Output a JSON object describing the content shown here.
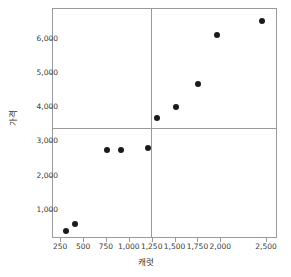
{
  "chart_data": {
    "type": "scatter",
    "title": "",
    "xlabel": "캐럿",
    "ylabel": "가격",
    "xlim": [
      160,
      2620
    ],
    "ylim": [
      180,
      6900
    ],
    "grid": false,
    "legend": null,
    "x_ticks": [
      250,
      500,
      750,
      1000,
      1250,
      1500,
      1750,
      2000,
      2500
    ],
    "x_tick_labels": [
      "250",
      "500",
      "750",
      "1,000",
      "1,250",
      "1,500",
      "1,750",
      "2,000",
      "2,500"
    ],
    "y_ticks": [
      1000,
      2000,
      3000,
      4000,
      5000,
      6000
    ],
    "y_tick_labels": [
      "1,000",
      "2,000",
      "3,000",
      "4,000",
      "5,000",
      "6,000"
    ],
    "reference_lines": {
      "vertical_x": 1230,
      "horizontal_y": 3430
    },
    "marker": {
      "shape": "circle",
      "color": "#1a1a1a",
      "size": 6
    },
    "points": [
      {
        "x": 300,
        "y": 420
      },
      {
        "x": 400,
        "y": 620
      },
      {
        "x": 750,
        "y": 2780
      },
      {
        "x": 900,
        "y": 2790
      },
      {
        "x": 1200,
        "y": 2830
      },
      {
        "x": 1300,
        "y": 3720
      },
      {
        "x": 1500,
        "y": 4050
      },
      {
        "x": 1740,
        "y": 4700
      },
      {
        "x": 1950,
        "y": 6150
      },
      {
        "x": 2440,
        "y": 6560
      }
    ]
  }
}
